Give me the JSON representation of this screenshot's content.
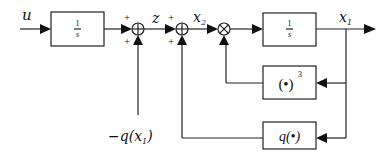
{
  "signals": {
    "input": "u",
    "z": "z",
    "x2": "x",
    "x2_sub": "2",
    "x1": "x",
    "x1_sub": "1",
    "disturbance_prefix": "−q(x",
    "disturbance_sub": "1",
    "disturbance_suffix": ")"
  },
  "blocks": {
    "integrator1": {
      "num": "1",
      "den": "s"
    },
    "integrator2": {
      "num": "1",
      "den": "s"
    },
    "cube": {
      "text": "(•)",
      "sup": "3"
    },
    "q": {
      "text": "q(•)"
    }
  },
  "sums": {
    "sum1": {
      "sign_left": "+",
      "sign_bottom": "+"
    },
    "sum2": {
      "sign_left": "+",
      "sign_bottom": "+"
    }
  },
  "multiplier": {
    "symbol": "×"
  }
}
